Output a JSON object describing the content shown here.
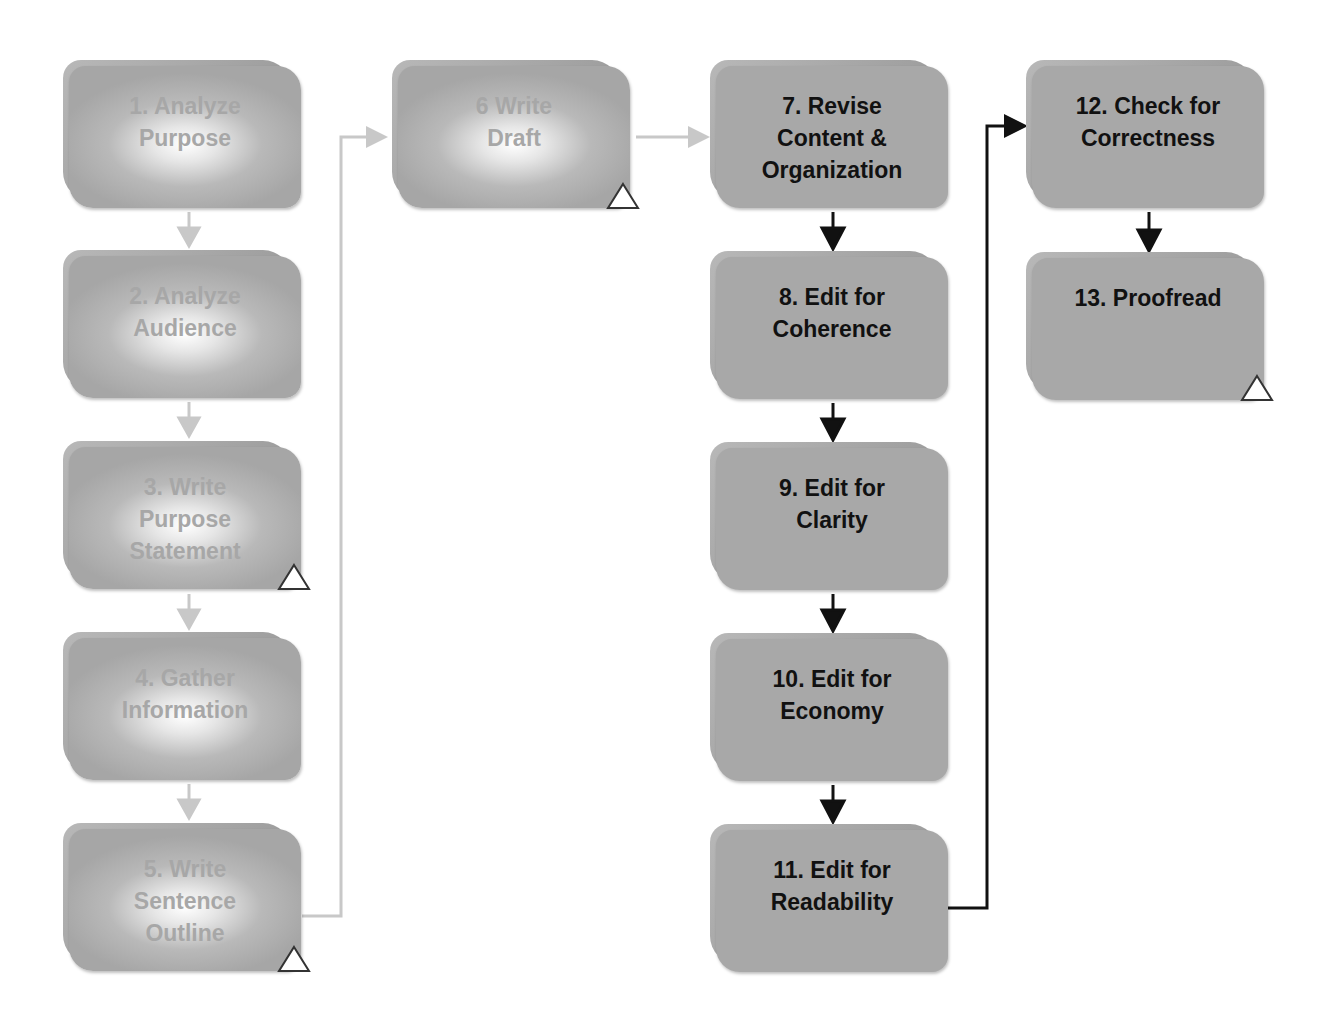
{
  "diagram": {
    "type": "flowchart",
    "colors": {
      "faded_text": "#a7a7a7",
      "active_text": "#111111",
      "faded_arrow": "#c8c8c8",
      "active_arrow": "#111111",
      "box_fill": "#a8a8a8"
    },
    "steps": [
      {
        "id": 1,
        "label": "1. Analyze\nPurpose",
        "state": "faded",
        "marker": false
      },
      {
        "id": 2,
        "label": "2. Analyze\nAudience",
        "state": "faded",
        "marker": false
      },
      {
        "id": 3,
        "label": "3. Write\nPurpose\nStatement",
        "state": "faded",
        "marker": true
      },
      {
        "id": 4,
        "label": "4. Gather\nInformation",
        "state": "faded",
        "marker": false
      },
      {
        "id": 5,
        "label": "5. Write\nSentence\nOutline",
        "state": "faded",
        "marker": true
      },
      {
        "id": 6,
        "label": "6 Write\nDraft",
        "state": "faded",
        "marker": true
      },
      {
        "id": 7,
        "label": "7. Revise\nContent &\nOrganization",
        "state": "active",
        "marker": false
      },
      {
        "id": 8,
        "label": "8. Edit for\nCoherence",
        "state": "active",
        "marker": false
      },
      {
        "id": 9,
        "label": "9. Edit for\nClarity",
        "state": "active",
        "marker": false
      },
      {
        "id": 10,
        "label": "10. Edit for\nEconomy",
        "state": "active",
        "marker": false
      },
      {
        "id": 11,
        "label": "11. Edit for\nReadability",
        "state": "active",
        "marker": false
      },
      {
        "id": 12,
        "label": "12. Check for\nCorrectness",
        "state": "active",
        "marker": false
      },
      {
        "id": 13,
        "label": "13. Proofread",
        "state": "active",
        "marker": true
      }
    ],
    "edges": [
      {
        "from": 1,
        "to": 2,
        "style": "faded"
      },
      {
        "from": 2,
        "to": 3,
        "style": "faded"
      },
      {
        "from": 3,
        "to": 4,
        "style": "faded"
      },
      {
        "from": 4,
        "to": 5,
        "style": "faded"
      },
      {
        "from": 5,
        "to": 6,
        "style": "faded"
      },
      {
        "from": 6,
        "to": 7,
        "style": "faded"
      },
      {
        "from": 7,
        "to": 8,
        "style": "active"
      },
      {
        "from": 8,
        "to": 9,
        "style": "active"
      },
      {
        "from": 9,
        "to": 10,
        "style": "active"
      },
      {
        "from": 10,
        "to": 11,
        "style": "active"
      },
      {
        "from": 11,
        "to": 12,
        "style": "active"
      },
      {
        "from": 12,
        "to": 13,
        "style": "active"
      }
    ]
  }
}
